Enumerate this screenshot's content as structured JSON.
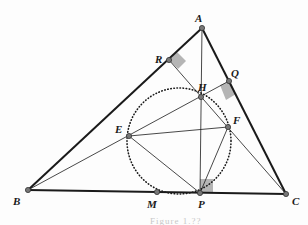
{
  "figure": {
    "caption_fragment": "Figure 1.??",
    "points": {
      "A": {
        "label": "A",
        "x": 202,
        "y": 28
      },
      "B": {
        "label": "B",
        "x": 28,
        "y": 190
      },
      "C": {
        "label": "C",
        "x": 286,
        "y": 194
      },
      "R": {
        "label": "R",
        "x": 169,
        "y": 60
      },
      "Q": {
        "label": "Q",
        "x": 229,
        "y": 81
      },
      "H": {
        "label": "H",
        "x": 201,
        "y": 97
      },
      "E": {
        "label": "E",
        "x": 129,
        "y": 136
      },
      "F": {
        "label": "F",
        "x": 228,
        "y": 127
      },
      "M": {
        "label": "M",
        "x": 157,
        "y": 192
      },
      "P": {
        "label": "P",
        "x": 200,
        "y": 193
      }
    },
    "circle": {
      "cx": 179,
      "cy": 141,
      "rx": 52,
      "ry": 53,
      "style": "dotted"
    },
    "colors": {
      "stroke": "#1a1a1a",
      "point_fill": "#777777",
      "right_angle_fill": "#b5b5b5"
    }
  }
}
